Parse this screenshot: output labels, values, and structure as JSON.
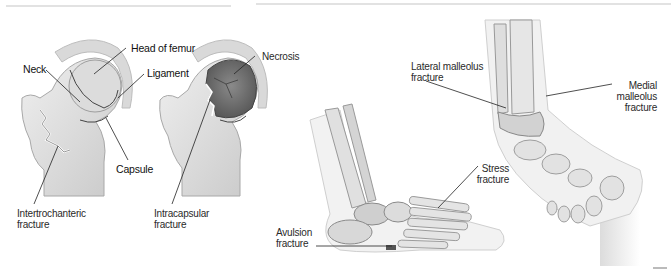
{
  "figures": [
    {
      "id": "hip",
      "title": "Hip fractures",
      "labels": {
        "neck": "Neck",
        "head_of_femur": "Head of femur",
        "ligament": "Ligament",
        "necrosis": "Necrosis",
        "capsule": "Capsule",
        "intertrochanteric": "Intertrochanteric\nfracture",
        "intracapsular": "Intracapsular\nfracture"
      }
    },
    {
      "id": "ankle-foot",
      "title": "Ankle and foot fractures",
      "labels": {
        "lateral_malleolus": "Lateral malleolus\nfracture",
        "medial_malleolus": "Medial\nmalleolus\nfracture",
        "stress": "Stress\nfracture",
        "avulsion": "Avulsion\nfracture"
      }
    }
  ],
  "colors": {
    "bone_light": "#e6e6e6",
    "bone_mid": "#cfcfcf",
    "bone_dark": "#9a9a9a",
    "necrosis": "#6e6e6e",
    "leader_line": "#222222",
    "rule": "#e2e2e2"
  }
}
